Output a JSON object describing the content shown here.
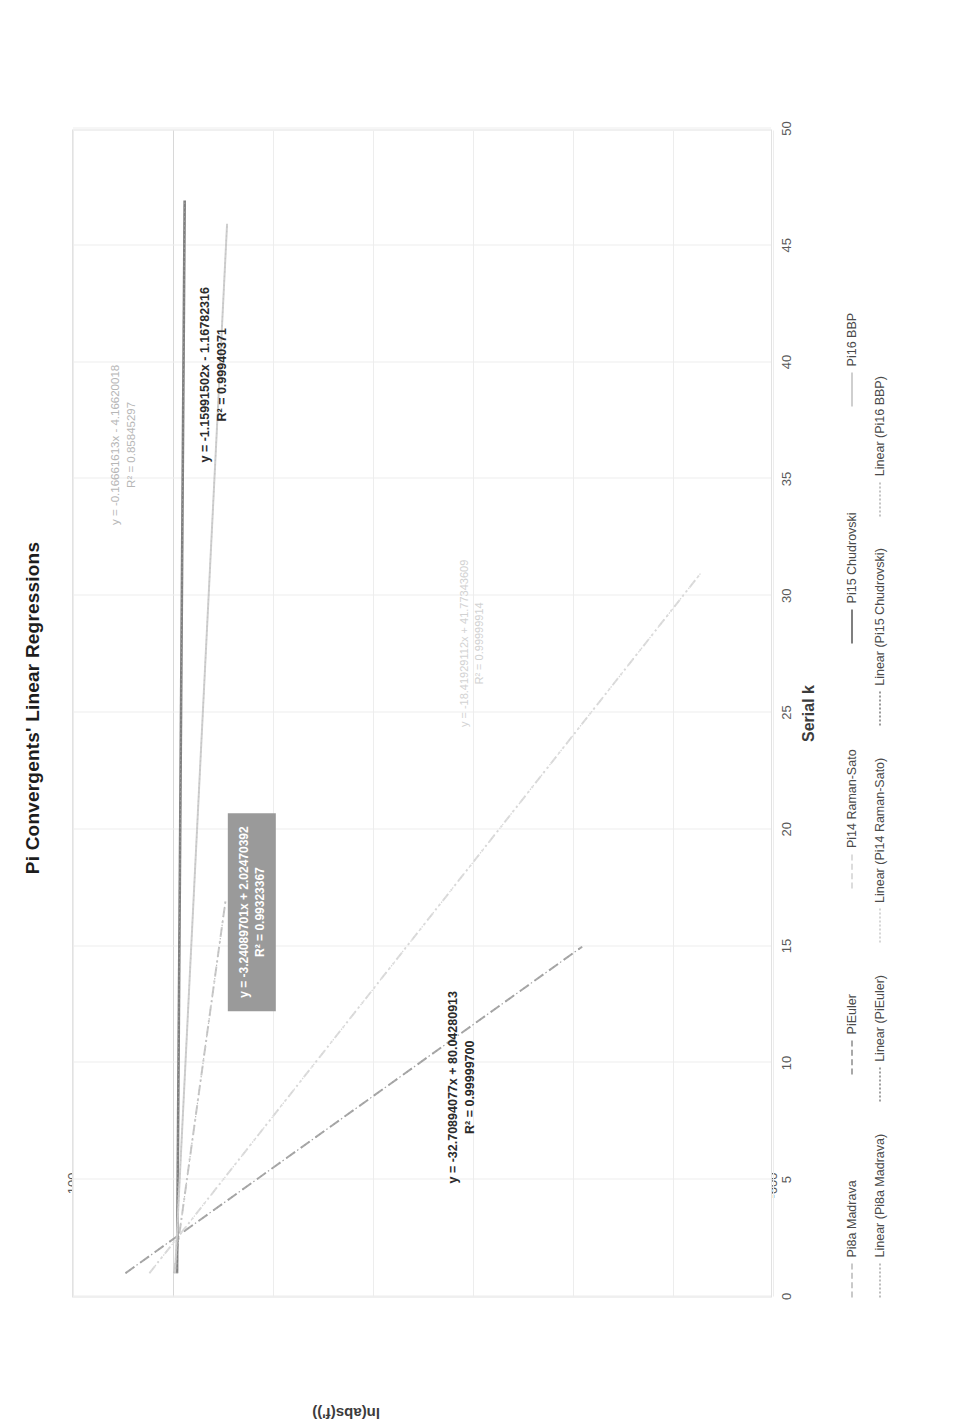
{
  "chart_data": {
    "type": "line",
    "title": "Pi Convergents' Linear Regressions",
    "xlabel": "Serial k",
    "ylabel": "ln(abs(f'))",
    "xlim": [
      0,
      50
    ],
    "ylim": [
      -600,
      100
    ],
    "xticks": [
      "0",
      "5",
      "10",
      "15",
      "20",
      "25",
      "30",
      "35",
      "40",
      "45",
      "50"
    ],
    "yticks": [
      "100",
      "0",
      "-100",
      "-200",
      "-300",
      "-400",
      "-500",
      "-600"
    ],
    "grid": true,
    "legend_position": "bottom",
    "series": [
      {
        "name": "Pi8a Madrava",
        "style": "dash-dot",
        "color": "#c9c9c9",
        "slope": -3.24089701,
        "intercept": 2.02470392,
        "r2": 0.99323367,
        "x_start": 1,
        "x_end": 17
      },
      {
        "name": "PiEuler",
        "style": "dashed",
        "color": "#a8a8a8",
        "slope": -32.70894077,
        "intercept": 80.04280913,
        "r2": 0.999997,
        "x_start": 1,
        "x_end": 15
      },
      {
        "name": "Pi14 Raman-Sato",
        "style": "dash-dot-dot",
        "color": "#dcdcdc",
        "slope": -18.41929112,
        "intercept": 41.77343609,
        "r2": 0.99999914,
        "x_start": 1,
        "x_end": 31
      },
      {
        "name": "Pi15 Chudrovski",
        "style": "solid",
        "color": "#7f7f7f",
        "slope": -0.16661613,
        "intercept": -4.16620018,
        "r2": 0.85845297,
        "x_start": 1,
        "x_end": 47
      },
      {
        "name": "Pi16 BBP",
        "style": "solid-light",
        "color": "#cfcfcf",
        "slope": -1.15991502,
        "intercept": -1.16782316,
        "r2": 0.99940371,
        "x_start": 1,
        "x_end": 46
      }
    ],
    "trendlines": [
      {
        "name": "Linear (Pi8a Madrava)",
        "style": "dotted",
        "color": "#bdbdbd"
      },
      {
        "name": "Linear (PiEuler)",
        "style": "dotted",
        "color": "#a0a0a0"
      },
      {
        "name": "Linear (Pi14 Raman-Sato)",
        "style": "dotted",
        "color": "#d6d6d6"
      },
      {
        "name": "Linear (Pi15 Chudrovski)",
        "style": "dotted",
        "color": "#9a9a9a"
      },
      {
        "name": "Linear (Pi16 BBP)",
        "style": "dotted",
        "color": "#c4c4c4"
      }
    ],
    "annotations": [
      {
        "id": "pi15",
        "equation": "y = -0.16661613x - 4.16620018",
        "r2_text": "R² = 0.85845297"
      },
      {
        "id": "pi16",
        "equation": "y = -1.15991502x - 1.16782316",
        "r2_text": "R² = 0.99940371"
      },
      {
        "id": "madrava",
        "equation": "y = -3.24089701x + 2.02470392",
        "r2_text": "R² = 0.99323367"
      },
      {
        "id": "raman",
        "equation": "y = -18.41929112x + 41.77343609",
        "r2_text": "R² = 0.99999914"
      },
      {
        "id": "euler",
        "equation": "y = -32.70894077x + 80.04280913",
        "r2_text": "R² = 0.99999700"
      }
    ]
  },
  "legend": {
    "row1": [
      {
        "label": "Pi8a Madrava",
        "color": "#c9c9c9",
        "dash": "dash-dot"
      },
      {
        "label": "PiEuler",
        "color": "#a8a8a8",
        "dash": "dashed"
      },
      {
        "label": "Pi14 Raman-Sato",
        "color": "#dcdcdc",
        "dash": "dash-dot-dot"
      },
      {
        "label": "Pi15 Chudrovski",
        "color": "#7f7f7f",
        "dash": "solid"
      },
      {
        "label": "Pi16 BBP",
        "color": "#cfcfcf",
        "dash": "solid"
      }
    ],
    "row2": [
      {
        "label": "Linear (Pi8a Madrava)",
        "color": "#bdbdbd",
        "dash": "dotted"
      },
      {
        "label": "Linear (PiEuler)",
        "color": "#a0a0a0",
        "dash": "dotted"
      },
      {
        "label": "Linear (Pi14 Raman-Sato)",
        "color": "#d6d6d6",
        "dash": "dotted"
      },
      {
        "label": "Linear (Pi15 Chudrovski)",
        "color": "#9a9a9a",
        "dash": "dotted"
      },
      {
        "label": "Linear (Pi16 BBP)",
        "color": "#c4c4c4",
        "dash": "dotted"
      }
    ]
  }
}
